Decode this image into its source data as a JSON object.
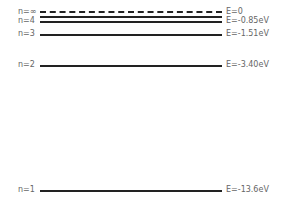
{
  "diagram": {
    "levels": [
      {
        "n_label": "n=∞",
        "energy_label": "E=0",
        "style": "dashed"
      },
      {
        "n_label": "n=4",
        "energy_label": "E=-0.85eV",
        "style": "solid"
      },
      {
        "n_label": "n=3",
        "energy_label": "E=-1.51eV",
        "style": "solid"
      },
      {
        "n_label": "n=2",
        "energy_label": "E=-3.40eV",
        "style": "solid"
      },
      {
        "n_label": "n=1",
        "energy_label": "E=-13.6eV",
        "style": "solid"
      }
    ]
  }
}
